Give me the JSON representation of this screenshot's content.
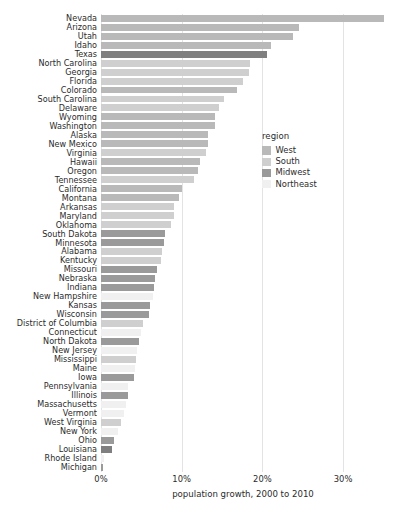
{
  "chart_data": {
    "type": "bar",
    "title": "",
    "xlabel": "population growth, 2000 to 2010",
    "ylabel": "",
    "orientation": "horizontal",
    "xlim": [
      0,
      35.2
    ],
    "xticks": [
      0,
      10,
      20,
      30
    ],
    "xticklabels": [
      "0%",
      "10%",
      "20%",
      "30%"
    ],
    "grid": "vertical gridlines at x ticks",
    "legend": {
      "title": "region",
      "position": "right, upper-middle of plot",
      "entries": [
        {
          "label": "West",
          "color": "#b9b9b9"
        },
        {
          "label": "South",
          "color": "#cfcfcf"
        },
        {
          "label": "Midwest",
          "color": "#9a9a9a"
        },
        {
          "label": "Northeast",
          "color": "#f0f0f0"
        }
      ]
    },
    "categories": [
      "Nevada",
      "Arizona",
      "Utah",
      "Idaho",
      "Texas",
      "North Carolina",
      "Georgia",
      "Florida",
      "Colorado",
      "South Carolina",
      "Delaware",
      "Wyoming",
      "Washington",
      "Alaska",
      "New Mexico",
      "Virginia",
      "Hawaii",
      "Oregon",
      "Tennessee",
      "California",
      "Montana",
      "Arkansas",
      "Maryland",
      "Oklahoma",
      "South Dakota",
      "Minnesota",
      "Alabama",
      "Kentucky",
      "Missouri",
      "Nebraska",
      "Indiana",
      "New Hampshire",
      "Kansas",
      "Wisconsin",
      "District of Columbia",
      "Connecticut",
      "North Dakota",
      "New Jersey",
      "Mississippi",
      "Maine",
      "Iowa",
      "Pennsylvania",
      "Illinois",
      "Massachusetts",
      "Vermont",
      "West Virginia",
      "New York",
      "Ohio",
      "Louisiana",
      "Rhode Island",
      "Michigan"
    ],
    "values": [
      35.1,
      24.6,
      23.8,
      21.1,
      20.6,
      18.5,
      18.3,
      17.6,
      16.9,
      15.3,
      14.6,
      14.1,
      14.1,
      13.3,
      13.2,
      13.0,
      12.3,
      12.0,
      11.5,
      10.0,
      9.7,
      9.1,
      9.0,
      8.7,
      7.9,
      7.8,
      7.5,
      7.4,
      7.0,
      6.7,
      6.6,
      6.5,
      6.1,
      6.0,
      5.2,
      4.9,
      4.7,
      4.5,
      4.3,
      4.2,
      4.1,
      3.4,
      3.3,
      3.1,
      2.8,
      2.5,
      2.1,
      1.6,
      1.4,
      0.4,
      -0.6
    ],
    "bar_regions": [
      "West",
      "West",
      "West",
      "West",
      "South-highlight",
      "South",
      "South",
      "South",
      "West",
      "South",
      "South",
      "West",
      "West",
      "West",
      "West",
      "South",
      "West",
      "West",
      "South",
      "West",
      "West",
      "South",
      "South",
      "South",
      "Midwest",
      "Midwest",
      "South",
      "South",
      "Midwest",
      "Midwest",
      "Midwest",
      "Northeast",
      "Midwest",
      "Midwest",
      "South",
      "Northeast",
      "Midwest",
      "Northeast",
      "South",
      "Northeast",
      "Midwest",
      "Northeast",
      "Midwest",
      "Northeast",
      "Northeast",
      "South",
      "Northeast",
      "Midwest",
      "South-highlight",
      "Northeast",
      "Midwest"
    ],
    "region_colors": {
      "West": "#b9b9b9",
      "South": "#cfcfcf",
      "Midwest": "#9a9a9a",
      "Northeast": "#f0f0f0",
      "South-highlight": "#7f7f7f"
    },
    "gridline_color": "#e3e3e3"
  }
}
